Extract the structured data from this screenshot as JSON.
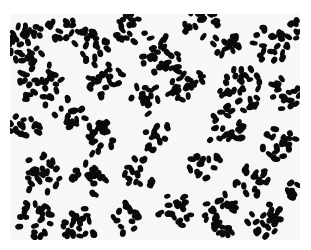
{
  "image": {
    "subject": "micrograph of dark oval cells in clustered chains on a light background",
    "background_color": "#f7f7f7",
    "cell_color": "#0a0a0a",
    "frame": {
      "x": 10,
      "y": 14,
      "width": 290,
      "height": 226
    },
    "clusters": [
      {
        "x": 20,
        "y": 30,
        "r": 22,
        "n": 34
      },
      {
        "x": 50,
        "y": 12,
        "r": 14,
        "n": 14
      },
      {
        "x": 80,
        "y": 30,
        "r": 18,
        "n": 22
      },
      {
        "x": 120,
        "y": 15,
        "r": 16,
        "n": 18
      },
      {
        "x": 150,
        "y": 40,
        "r": 20,
        "n": 26
      },
      {
        "x": 190,
        "y": 10,
        "r": 18,
        "n": 20
      },
      {
        "x": 215,
        "y": 30,
        "r": 14,
        "n": 16
      },
      {
        "x": 262,
        "y": 30,
        "r": 20,
        "n": 24
      },
      {
        "x": 285,
        "y": 15,
        "r": 10,
        "n": 8
      },
      {
        "x": 30,
        "y": 70,
        "r": 22,
        "n": 30
      },
      {
        "x": 95,
        "y": 65,
        "r": 18,
        "n": 22
      },
      {
        "x": 135,
        "y": 85,
        "r": 16,
        "n": 18
      },
      {
        "x": 175,
        "y": 70,
        "r": 20,
        "n": 24
      },
      {
        "x": 230,
        "y": 75,
        "r": 24,
        "n": 34
      },
      {
        "x": 275,
        "y": 80,
        "r": 16,
        "n": 16
      },
      {
        "x": 15,
        "y": 115,
        "r": 16,
        "n": 18
      },
      {
        "x": 60,
        "y": 100,
        "r": 16,
        "n": 16
      },
      {
        "x": 90,
        "y": 125,
        "r": 18,
        "n": 22
      },
      {
        "x": 150,
        "y": 125,
        "r": 16,
        "n": 16
      },
      {
        "x": 215,
        "y": 115,
        "r": 20,
        "n": 24
      },
      {
        "x": 270,
        "y": 130,
        "r": 18,
        "n": 20
      },
      {
        "x": 30,
        "y": 160,
        "r": 20,
        "n": 24
      },
      {
        "x": 80,
        "y": 165,
        "r": 18,
        "n": 22
      },
      {
        "x": 130,
        "y": 160,
        "r": 16,
        "n": 16
      },
      {
        "x": 195,
        "y": 150,
        "r": 16,
        "n": 16
      },
      {
        "x": 240,
        "y": 165,
        "r": 18,
        "n": 20
      },
      {
        "x": 25,
        "y": 205,
        "r": 18,
        "n": 22
      },
      {
        "x": 70,
        "y": 210,
        "r": 18,
        "n": 22
      },
      {
        "x": 115,
        "y": 205,
        "r": 16,
        "n": 18
      },
      {
        "x": 165,
        "y": 195,
        "r": 18,
        "n": 20
      },
      {
        "x": 210,
        "y": 200,
        "r": 22,
        "n": 28
      },
      {
        "x": 255,
        "y": 205,
        "r": 18,
        "n": 22
      },
      {
        "x": 285,
        "y": 175,
        "r": 10,
        "n": 8
      }
    ]
  }
}
